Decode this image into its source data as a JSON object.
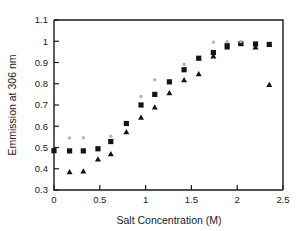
{
  "chart_data": {
    "type": "scatter",
    "title": "",
    "xlabel": "Salt Concentration (M)",
    "ylabel": "Emmission at 306 nm",
    "xlim": [
      0,
      2.5
    ],
    "ylim": [
      0.3,
      1.1
    ],
    "xticks": [
      0,
      0.5,
      1,
      1.5,
      2,
      2.5
    ],
    "xticklabels": [
      "0",
      "0.5",
      "1",
      "1.5",
      "2",
      "2.5"
    ],
    "yticks": [
      0.3,
      0.4,
      0.5,
      0.6,
      0.7,
      0.8,
      0.9,
      1.0,
      1.1
    ],
    "yticklabels": [
      "0.3",
      "0.4",
      "0.5",
      "0.6",
      "0.7",
      "0.8",
      "0.9",
      "1",
      "1.1"
    ],
    "grid": false,
    "legend": "none",
    "series": [
      {
        "name": "squares",
        "marker": "square",
        "color": "#141414",
        "points": [
          {
            "x": 0.0,
            "y": 0.485
          },
          {
            "x": 0.17,
            "y": 0.484
          },
          {
            "x": 0.32,
            "y": 0.484
          },
          {
            "x": 0.48,
            "y": 0.494
          },
          {
            "x": 0.62,
            "y": 0.528
          },
          {
            "x": 0.79,
            "y": 0.613
          },
          {
            "x": 0.95,
            "y": 0.7
          },
          {
            "x": 1.1,
            "y": 0.75
          },
          {
            "x": 1.26,
            "y": 0.809
          },
          {
            "x": 1.42,
            "y": 0.866
          },
          {
            "x": 1.58,
            "y": 0.92
          },
          {
            "x": 1.74,
            "y": 0.947
          },
          {
            "x": 1.89,
            "y": 0.979
          },
          {
            "x": 2.04,
            "y": 0.989
          },
          {
            "x": 2.2,
            "y": 0.987
          },
          {
            "x": 2.35,
            "y": 0.985
          }
        ]
      },
      {
        "name": "triangles",
        "marker": "triangle",
        "color": "#141414",
        "points": [
          {
            "x": 0.17,
            "y": 0.385
          },
          {
            "x": 0.32,
            "y": 0.388
          },
          {
            "x": 0.48,
            "y": 0.445
          },
          {
            "x": 0.62,
            "y": 0.47
          },
          {
            "x": 0.79,
            "y": 0.573
          },
          {
            "x": 0.95,
            "y": 0.641
          },
          {
            "x": 1.1,
            "y": 0.69
          },
          {
            "x": 1.26,
            "y": 0.757
          },
          {
            "x": 1.42,
            "y": 0.818
          },
          {
            "x": 1.58,
            "y": 0.846
          },
          {
            "x": 1.74,
            "y": 0.93
          },
          {
            "x": 1.89,
            "y": 0.972
          },
          {
            "x": 2.04,
            "y": 0.99
          },
          {
            "x": 2.2,
            "y": 0.972
          },
          {
            "x": 2.35,
            "y": 0.795
          }
        ]
      },
      {
        "name": "gray-dots",
        "marker": "dot",
        "color": "#b4b4b4",
        "points": [
          {
            "x": 0.17,
            "y": 0.545
          },
          {
            "x": 0.32,
            "y": 0.546
          },
          {
            "x": 0.62,
            "y": 0.553
          },
          {
            "x": 0.95,
            "y": 0.74
          },
          {
            "x": 1.1,
            "y": 0.819
          },
          {
            "x": 1.42,
            "y": 0.892
          },
          {
            "x": 1.74,
            "y": 0.996
          },
          {
            "x": 1.89,
            "y": 0.998
          },
          {
            "x": 2.04,
            "y": 0.999
          }
        ]
      }
    ]
  },
  "axes": {
    "x_title": "Salt Concentration (M)",
    "y_title": "Emmission at 306 nm"
  }
}
